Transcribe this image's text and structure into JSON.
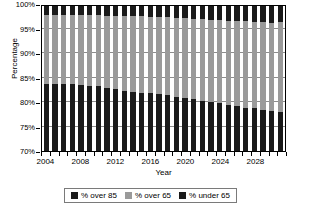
{
  "chart_data": {
    "type": "bar",
    "subtype": "100% stacked column",
    "title": "",
    "xlabel": "Year",
    "ylabel": "Percentage",
    "ylim": [
      70,
      100
    ],
    "yticks": [
      70,
      75,
      80,
      85,
      90,
      95,
      100
    ],
    "ytick_labels": [
      "70%",
      "75%",
      "80%",
      "85%",
      "90%",
      "95%",
      "100%"
    ],
    "grid": true,
    "legend_position": "bottom",
    "x": [
      2004,
      2005,
      2006,
      2007,
      2008,
      2009,
      2010,
      2011,
      2012,
      2013,
      2014,
      2015,
      2016,
      2017,
      2018,
      2019,
      2020,
      2021,
      2022,
      2023,
      2024,
      2025,
      2026,
      2027,
      2028,
      2029,
      2030,
      2031
    ],
    "categories": [
      "2004",
      "2005",
      "2006",
      "2007",
      "2008",
      "2009",
      "2010",
      "2011",
      "2012",
      "2013",
      "2014",
      "2015",
      "2016",
      "2017",
      "2018",
      "2019",
      "2020",
      "2021",
      "2022",
      "2023",
      "2024",
      "2025",
      "2026",
      "2027",
      "2028",
      "2029",
      "2030",
      "2031"
    ],
    "xtick_labels": [
      "2004",
      "2008",
      "2012",
      "2016",
      "2020",
      "2024",
      "2028"
    ],
    "xtick_values": [
      2004,
      2008,
      2012,
      2016,
      2020,
      2024,
      2028
    ],
    "stack_order_bottom_to_top": [
      "% under 65",
      "% over 65",
      "% over 85"
    ],
    "series": [
      {
        "name": "% under 65",
        "color": "#1a1a1a",
        "values": [
          83.9,
          83.9,
          83.9,
          83.8,
          83.7,
          83.5,
          83.4,
          83.1,
          82.8,
          82.5,
          82.3,
          82.1,
          81.9,
          81.7,
          81.5,
          81.2,
          81.0,
          80.7,
          80.4,
          80.1,
          79.9,
          79.6,
          79.3,
          79.0,
          78.8,
          78.5,
          78.3,
          78.1
        ]
      },
      {
        "name": "% over 65",
        "color": "#9a9a9a",
        "values": [
          14.3,
          14.3,
          14.3,
          14.3,
          14.4,
          14.6,
          14.7,
          14.9,
          15.2,
          15.4,
          15.6,
          15.8,
          15.9,
          16.1,
          16.2,
          16.4,
          16.5,
          16.7,
          16.9,
          17.1,
          17.2,
          17.4,
          17.6,
          17.8,
          17.9,
          18.1,
          18.2,
          18.6
        ]
      },
      {
        "name": "% over 85",
        "color": "#1a1a1a",
        "values": [
          1.8,
          1.8,
          1.8,
          1.9,
          1.9,
          1.9,
          1.9,
          2.0,
          2.0,
          2.1,
          2.1,
          2.1,
          2.2,
          2.2,
          2.3,
          2.4,
          2.5,
          2.6,
          2.7,
          2.8,
          2.9,
          3.0,
          3.1,
          3.2,
          3.3,
          3.4,
          3.5,
          3.3
        ]
      }
    ]
  },
  "axes": {
    "y_title": "Percentage",
    "x_title": "Year"
  },
  "legend": {
    "items": [
      {
        "label": "% over 85",
        "color": "#1a1a1a"
      },
      {
        "label": "% over 65",
        "color": "#9a9a9a"
      },
      {
        "label": "% under 65",
        "color": "#1a1a1a"
      }
    ]
  },
  "colors": {
    "over_85": "#1a1a1a",
    "over_65": "#9a9a9a",
    "under_65": "#1a1a1a",
    "gridline": "#8c8c8c",
    "axis": "#000000",
    "background": "#ffffff"
  }
}
